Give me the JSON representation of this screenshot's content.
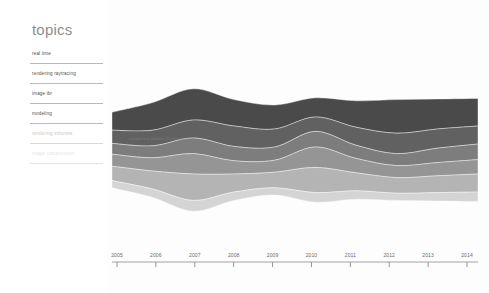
{
  "sidebar": {
    "title": "topics",
    "items": [
      {
        "label": "real time",
        "state": "active"
      },
      {
        "label": "rendering raytracing",
        "state": "active"
      },
      {
        "label": "image ibr",
        "state": "active"
      },
      {
        "label": "modeling",
        "state": "active"
      },
      {
        "label": "rendering volumes",
        "state": "dim"
      },
      {
        "label": "image compression",
        "state": "faint"
      }
    ]
  },
  "colors": {
    "band_1": "#4a4a4a",
    "band_2": "#616161",
    "band_3": "#7d7d7d",
    "band_4": "#959595",
    "band_5": "#b4b4b4",
    "band_6": "#d4d4d4",
    "axis": "#8c8c8c",
    "text": "#4f4f4f",
    "title": "#8e8e8e",
    "background": "#ffffff"
  },
  "inline_labels": [
    {
      "text": "rendering global illumination",
      "x": 22,
      "y": 136
    }
  ],
  "chart_data": {
    "type": "area",
    "title": "topics",
    "subtype": "streamgraph",
    "xlabel": "",
    "ylabel": "",
    "grid": false,
    "legend_position": "sidebar-left",
    "xlim": [
      2005,
      2014
    ],
    "x": [
      2005,
      2006,
      2007,
      2008,
      2009,
      2010,
      2011,
      2012,
      2013,
      2014
    ],
    "categories": [
      "2005",
      "2006",
      "2007",
      "2008",
      "2009",
      "2010",
      "2011",
      "2012",
      "2013",
      "2014"
    ],
    "series": [
      {
        "name": "real time",
        "color": "#4a4a4a",
        "values": [
          30,
          46,
          52,
          44,
          40,
          32,
          44,
          56,
          50,
          46
        ]
      },
      {
        "name": "rendering raytracing",
        "color": "#616161",
        "values": [
          22,
          26,
          30,
          34,
          30,
          24,
          30,
          34,
          32,
          30
        ]
      },
      {
        "name": "image ibr",
        "color": "#7d7d7d",
        "values": [
          18,
          20,
          26,
          24,
          22,
          26,
          22,
          20,
          24,
          26
        ]
      },
      {
        "name": "modeling",
        "color": "#959595",
        "values": [
          20,
          22,
          34,
          22,
          20,
          34,
          24,
          20,
          22,
          24
        ]
      },
      {
        "name": "rendering volumes",
        "color": "#b4b4b4",
        "values": [
          24,
          30,
          44,
          30,
          26,
          42,
          30,
          26,
          28,
          30
        ]
      },
      {
        "name": "image compression",
        "color": "#d4d4d4",
        "values": [
          12,
          14,
          18,
          14,
          12,
          16,
          14,
          12,
          14,
          16
        ]
      }
    ]
  },
  "axis": {
    "ticks": [
      "2005",
      "2006",
      "2007",
      "2008",
      "2009",
      "2010",
      "2011",
      "2012",
      "2013",
      "2014"
    ]
  }
}
